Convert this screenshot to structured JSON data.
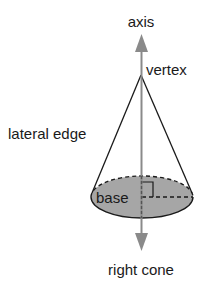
{
  "diagram": {
    "title": "right cone",
    "labels": {
      "axis": "axis",
      "vertex": "vertex",
      "lateral_edge": "lateral edge",
      "base": "base",
      "caption": "right cone"
    },
    "colors": {
      "axis": "#8a8a8a",
      "base_fill": "#a6a6a6",
      "lines": "#1a1a1a"
    }
  }
}
